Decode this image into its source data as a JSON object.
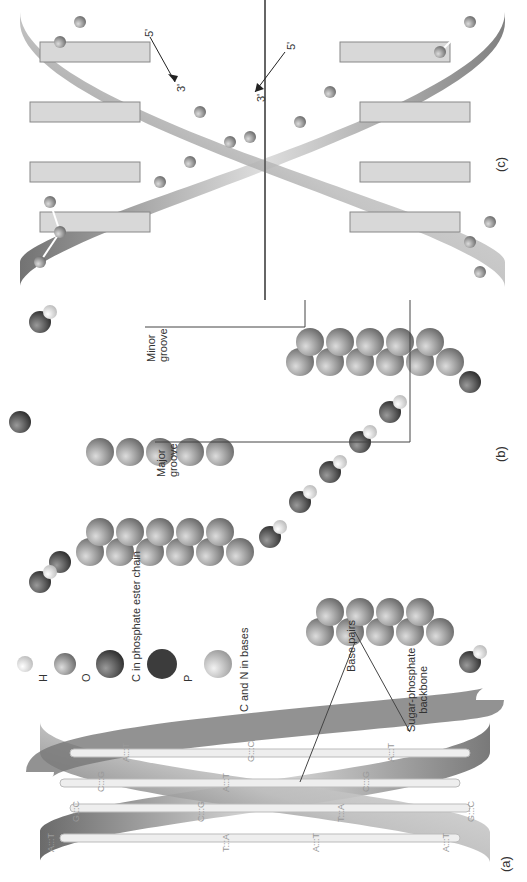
{
  "figure": {
    "panels": [
      {
        "id": "a",
        "label": "(a)",
        "description": "Ribbon model of double helix with labeled base pairs"
      },
      {
        "id": "b",
        "label": "(b)",
        "description": "Space-filling model"
      },
      {
        "id": "c",
        "label": "(c)",
        "description": "Ball-and-stick model"
      }
    ],
    "panel_a": {
      "label": "(a)",
      "base_pairs": [
        "A:::T",
        "G:::C",
        "C:::G",
        "A:::T",
        "T:::A",
        "C:::G",
        "A:::T",
        "G:::C",
        "A:::T",
        "T:::A",
        "C:::G",
        "A:::T",
        "A:::T",
        "G:::C"
      ],
      "callouts": {
        "base_pairs": "Base pairs",
        "backbone_line1": "Sugar-phosphate",
        "backbone_line2": "backbone"
      }
    },
    "legend": {
      "items": [
        {
          "symbol": "H",
          "label": "H",
          "color": "#e6e6e6"
        },
        {
          "symbol": "O",
          "label": "O",
          "color": "#b5b5b5"
        },
        {
          "symbol": "C-ester",
          "label": "C in phosphate ester chain",
          "color": "#6e6e6e"
        },
        {
          "symbol": "P",
          "label": "P",
          "color": "#3c3c3c"
        },
        {
          "symbol": "CN",
          "label": "C and N in bases",
          "color": "#bdbdbd"
        }
      ]
    },
    "panel_b": {
      "label": "(b)",
      "grooves": {
        "minor_line1": "Minor",
        "minor_line2": "groove",
        "major_line1": "Major",
        "major_line2": "groove"
      }
    },
    "panel_c": {
      "label": "(c)",
      "strand1": {
        "start": "5'",
        "end": "3'"
      },
      "strand2": {
        "start": "5'",
        "end": "3'"
      }
    }
  }
}
